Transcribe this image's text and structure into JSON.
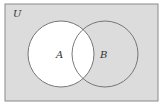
{
  "diagram": {
    "type": "venn",
    "universe_label": "U",
    "sets": [
      {
        "label": "A",
        "shaded": false
      },
      {
        "label": "B",
        "shaded": true
      }
    ],
    "highlighted_region": "A",
    "colors": {
      "background": "#dcdcdc",
      "highlight": "#ffffff",
      "stroke": "#6a6a6a"
    }
  }
}
